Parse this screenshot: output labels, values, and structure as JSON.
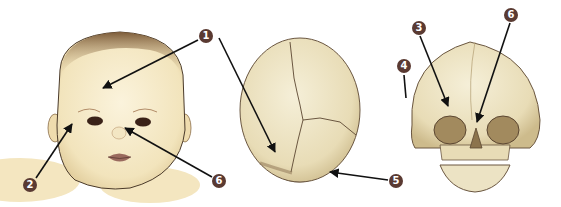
{
  "diagram": {
    "title": "",
    "panels": [
      {
        "id": "baby-face",
        "label": "Infant face (front view)"
      },
      {
        "id": "skull-top",
        "label": "Infant skull (top view)"
      },
      {
        "id": "skull-front",
        "label": "Infant skull (front view)"
      }
    ],
    "markers": [
      {
        "id": "m1",
        "number": "1",
        "x": 206,
        "y": 36
      },
      {
        "id": "m2",
        "number": "2",
        "x": 30,
        "y": 185
      },
      {
        "id": "m3",
        "number": "3",
        "x": 419,
        "y": 28
      },
      {
        "id": "m4",
        "number": "4",
        "x": 404,
        "y": 66
      },
      {
        "id": "m5",
        "number": "5",
        "x": 396,
        "y": 181
      },
      {
        "id": "m6a",
        "number": "6",
        "x": 219,
        "y": 181
      },
      {
        "id": "m6b",
        "number": "6",
        "x": 511,
        "y": 15
      }
    ],
    "colors": {
      "marker_fill": "#5a3a32",
      "skin": "#f6e9c6",
      "bone": "#ece3c4",
      "hair": "#8a6a44",
      "outline": "#5b4631",
      "arrow": "#111111"
    }
  }
}
